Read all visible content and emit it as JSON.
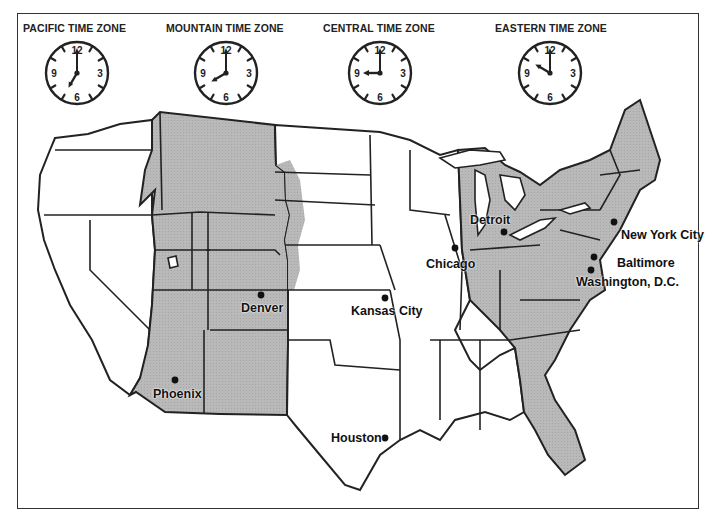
{
  "zones": [
    {
      "label": "PACIFIC TIME ZONE",
      "time": "7:00",
      "hour": 7,
      "minute": 0
    },
    {
      "label": "MOUNTAIN TIME ZONE",
      "time": "8:00",
      "hour": 8,
      "minute": 0
    },
    {
      "label": "CENTRAL TIME ZONE",
      "time": "9:00",
      "hour": 9,
      "minute": 0
    },
    {
      "label": "EASTERN TIME ZONE",
      "time": "10:00",
      "hour": 10,
      "minute": 0
    }
  ],
  "clock_numerals": {
    "n12": "12",
    "n3": "3",
    "n6": "6",
    "n9": "9"
  },
  "cities": [
    {
      "name": "Detroit"
    },
    {
      "name": "Chicago"
    },
    {
      "name": "New York City"
    },
    {
      "name": "Baltimore"
    },
    {
      "name": "Washington, D.C."
    },
    {
      "name": "Denver"
    },
    {
      "name": "Kansas City"
    },
    {
      "name": "Phoenix"
    },
    {
      "name": "Houston"
    }
  ],
  "colors": {
    "shaded_zone": "#b8b8b8",
    "unshaded_zone": "#ffffff",
    "border": "#222222"
  }
}
